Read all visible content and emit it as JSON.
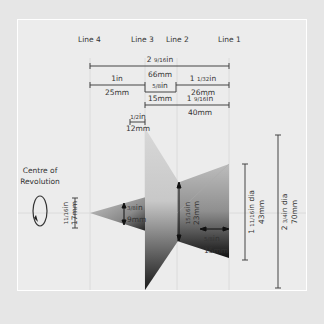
{
  "lines": {
    "line4": "Line 4",
    "line3": "Line 3",
    "line2": "Line 2",
    "line1": "Line 1"
  },
  "dimensions": {
    "overall": {
      "in_whole": "2",
      "in_frac": "9/16",
      "in_unit": "in",
      "mm": "66mm"
    },
    "line4_to_3": {
      "in": "1in",
      "mm": "25mm"
    },
    "line3_to_2": {
      "in_frac": "5/8",
      "in_unit": "in",
      "mm": "15mm"
    },
    "line2_to_1": {
      "in_whole": "1",
      "in_frac": "1/32",
      "in_unit": "in",
      "mm": "26mm"
    },
    "line3_to_1": {
      "in_whole": "1",
      "in_frac": "9/16",
      "in_unit": "in",
      "mm": "40mm"
    },
    "offset_left": {
      "in_frac": "1/2",
      "in_unit": "in",
      "mm": "12mm"
    },
    "small_cone_dia": {
      "in_frac": "11/16",
      "in_unit": "in",
      "mm": "17mm"
    },
    "small_cone_gap": {
      "in_frac": "3/8",
      "in_unit": "in",
      "mm": "9mm"
    },
    "neck": {
      "in_frac": "15/16",
      "in_unit": "in",
      "mm": "23mm"
    },
    "right_depth": {
      "in_frac": "5/8",
      "in_unit": "in",
      "mm": "15mm"
    },
    "right_dia": {
      "in_whole": "1",
      "in_frac": "11/16",
      "in_unit": "in dia",
      "mm": "43mm"
    },
    "overall_dia": {
      "in_whole": "2",
      "in_frac": "3/4",
      "in_unit": "in dia",
      "mm": "70mm"
    }
  },
  "centre_label": {
    "line1": "Centre of",
    "line2": "Revolution"
  },
  "colors": {
    "background": "#e6e6e6",
    "panel": "#ececec",
    "ink": "#333333"
  }
}
